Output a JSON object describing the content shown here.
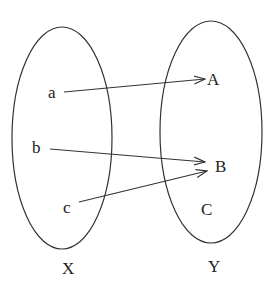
{
  "diagram": {
    "type": "function-mapping",
    "sets": [
      {
        "name": "X",
        "elements": [
          "a",
          "b",
          "c"
        ]
      },
      {
        "name": "Y",
        "elements": [
          "A",
          "B",
          "C"
        ]
      }
    ],
    "labels": {
      "a": "a",
      "b": "b",
      "c": "c",
      "A": "A",
      "B": "B",
      "C": "C",
      "X": "X",
      "Y": "Y"
    },
    "mappings": [
      {
        "from": "a",
        "to": "A"
      },
      {
        "from": "b",
        "to": "B"
      },
      {
        "from": "c",
        "to": "B"
      }
    ],
    "colors": {
      "stroke": "#333333",
      "text": "#222222",
      "background": "#ffffff"
    }
  }
}
